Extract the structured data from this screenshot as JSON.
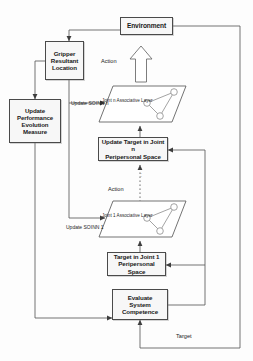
{
  "diagram": {
    "background_color": "#fdfdfd",
    "node_fill": "#f7f7f7",
    "node_stroke": "#4a4a4a",
    "line_color": "#5a5a5a"
  },
  "nodes": {
    "environment": {
      "label": "Environment"
    },
    "gripper": {
      "line1": "Gripper",
      "line2": "Resultant",
      "line3": "Location"
    },
    "update_performance": {
      "line1": "Update",
      "line2": "Performance",
      "line3": "Evolution",
      "line4": "Measure"
    },
    "update_target_n": {
      "line1": "Update Target in Joint n",
      "line2": "Peripersonal Space"
    },
    "target_joint_1": {
      "line1": "Target in Joint 1",
      "line2": "Peripersonal Space"
    },
    "evaluate": {
      "line1": "Evaluate",
      "line2": "System",
      "line3": "Competence"
    }
  },
  "planes": {
    "joint_n": {
      "line1": "Joint n",
      "line2": "Associative Layer"
    },
    "joint_1": {
      "line1": "Joint 1",
      "line2": "Associative Layer"
    }
  },
  "labels": {
    "action_top": "Action",
    "action_mid": "Action",
    "update_soinn_n_line1": "Update",
    "update_soinn_n_line2": "SOINN n",
    "update_soinn_1_line1": "Update",
    "update_soinn_1_line2": "SOINN 1",
    "target": "Target",
    "vertical_ellipsis": "···"
  },
  "icons": {
    "block_arrow_up": "block-arrow-up-icon",
    "dotted_action_arrow": "dotted-arrow-up-icon"
  }
}
